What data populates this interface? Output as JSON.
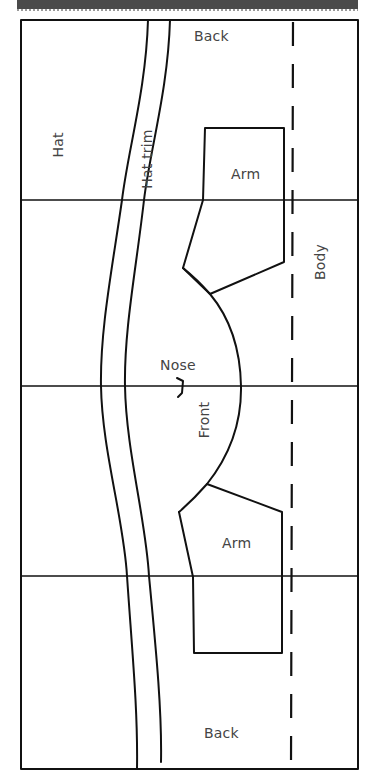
{
  "diagram": {
    "type": "sewing-pattern",
    "colors": {
      "line": "#111111",
      "label": "#444444",
      "header_bar": "#4a4a4a",
      "background": "#ffffff"
    },
    "labels": {
      "back_top": "Back",
      "back_bottom": "Back",
      "hat": "Hat",
      "hat_trim": "Hat trim",
      "arm_top": "Arm",
      "arm_bottom": "Arm",
      "body": "Body",
      "nose": "Nose",
      "front": "Front"
    },
    "pieces": [
      {
        "name": "Back",
        "position": "top"
      },
      {
        "name": "Hat",
        "orientation": "vertical"
      },
      {
        "name": "Hat trim",
        "orientation": "vertical"
      },
      {
        "name": "Arm",
        "position": "upper"
      },
      {
        "name": "Body",
        "orientation": "vertical",
        "edge": "dashed fold line"
      },
      {
        "name": "Nose",
        "marker": "notch"
      },
      {
        "name": "Front",
        "orientation": "vertical"
      },
      {
        "name": "Arm",
        "position": "lower"
      },
      {
        "name": "Back",
        "position": "bottom"
      }
    ],
    "grid": {
      "horizontal_divisions": 4
    }
  }
}
